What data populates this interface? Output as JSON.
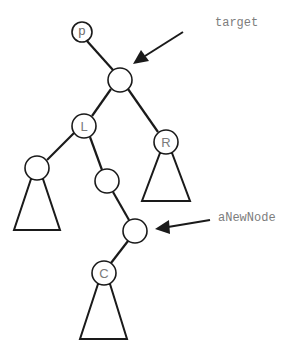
{
  "diagram": {
    "nodes": {
      "p": {
        "label": "p",
        "cx": 82,
        "cy": 32,
        "r": 10
      },
      "target": {
        "label": "",
        "cx": 120,
        "cy": 80,
        "r": 12
      },
      "L": {
        "label": "L",
        "cx": 84,
        "cy": 126,
        "r": 12
      },
      "R": {
        "label": "R",
        "cx": 166,
        "cy": 142,
        "r": 12
      },
      "LL": {
        "label": "",
        "cx": 37,
        "cy": 168,
        "r": 12
      },
      "LR": {
        "label": "",
        "cx": 107,
        "cy": 181,
        "r": 12
      },
      "aNewNode": {
        "label": "",
        "cx": 135,
        "cy": 231,
        "r": 12
      },
      "C": {
        "label": "C",
        "cx": 104,
        "cy": 273,
        "r": 12
      }
    },
    "edges": [
      [
        "p",
        "target"
      ],
      [
        "target",
        "L"
      ],
      [
        "target",
        "R"
      ],
      [
        "L",
        "LL"
      ],
      [
        "L",
        "LR"
      ],
      [
        "LR",
        "aNewNode"
      ],
      [
        "aNewNode",
        "C"
      ]
    ],
    "subtrees": [
      {
        "under": "LL",
        "points": "31,180 43,180 60,230 14,230"
      },
      {
        "under": "R",
        "points": "160,154 172,154 190,201 142,201"
      },
      {
        "under": "C",
        "points": "98,285 110,285 127,299 80,339"
      }
    ],
    "annotations": [
      {
        "id": "target",
        "text": "target",
        "x": 215,
        "y": 26,
        "arrow_from": [
          183,
          32
        ],
        "arrow_to": [
          135,
          62
        ]
      },
      {
        "id": "aNewNode",
        "text": "aNewNode",
        "x": 218,
        "y": 221,
        "arrow_from": [
          210,
          220
        ],
        "arrow_to": [
          155,
          229
        ]
      }
    ],
    "colors": {
      "stroke": "#1a1a1a",
      "label_text": "#7a7a7a",
      "background": "#ffffff"
    }
  }
}
